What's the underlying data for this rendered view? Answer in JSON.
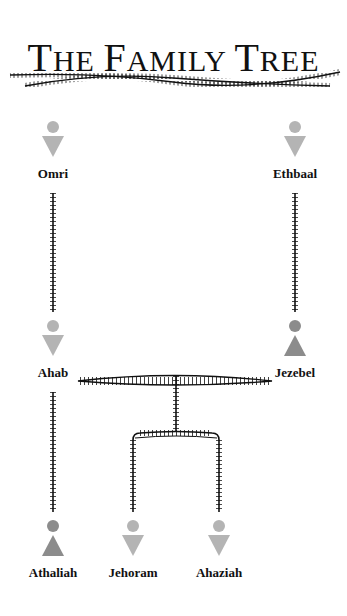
{
  "title": {
    "parts": [
      "T",
      "HE ",
      "F",
      "AMILY ",
      "T",
      "REE"
    ],
    "text": "The Family Tree"
  },
  "colors": {
    "male": "#b4b4b4",
    "female": "#8c8c8c",
    "line": "#111111",
    "text": "#111111"
  },
  "people": [
    {
      "id": "omri",
      "name": "Omri",
      "gender": "male",
      "icon": "male-icon"
    },
    {
      "id": "ethbaal",
      "name": "Ethbaal",
      "gender": "male",
      "icon": "male-icon"
    },
    {
      "id": "ahab",
      "name": "Ahab",
      "gender": "male",
      "icon": "male-icon"
    },
    {
      "id": "jezebel",
      "name": "Jezebel",
      "gender": "female",
      "icon": "female-icon"
    },
    {
      "id": "athaliah",
      "name": "Athaliah",
      "gender": "female",
      "icon": "female-icon"
    },
    {
      "id": "jehoram",
      "name": "Jehoram",
      "gender": "male",
      "icon": "male-icon"
    },
    {
      "id": "ahaziah",
      "name": "Ahaziah",
      "gender": "male",
      "icon": "male-icon"
    }
  ],
  "relations": [
    {
      "type": "parent-child",
      "from": "Omri",
      "to": "Ahab"
    },
    {
      "type": "parent-child",
      "from": "Ethbaal",
      "to": "Jezebel"
    },
    {
      "type": "marriage",
      "from": "Ahab",
      "to": "Jezebel"
    },
    {
      "type": "parent-child",
      "from": "Ahab",
      "to": "Athaliah"
    },
    {
      "type": "parent-child",
      "from": "Ahab & Jezebel",
      "to": "Jehoram"
    },
    {
      "type": "parent-child",
      "from": "Ahab & Jezebel",
      "to": "Ahaziah"
    }
  ]
}
